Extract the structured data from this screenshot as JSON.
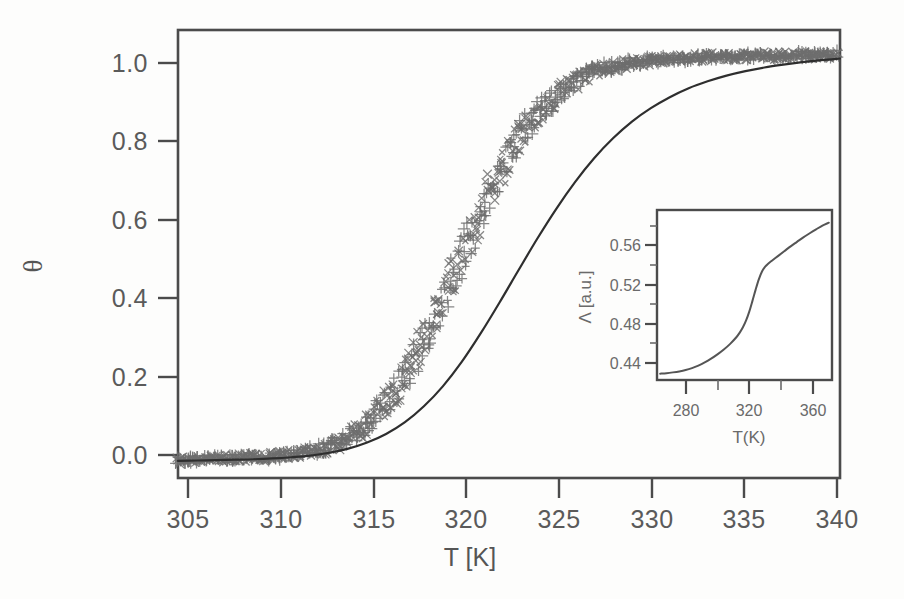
{
  "figure": {
    "background_color": "#fdfdfc",
    "ink_color": "#4b4b4b",
    "marker_color": "#6e6e6e",
    "fit_color": "#2e2e2e"
  },
  "chart_data": {
    "type": "line",
    "title": "",
    "subtitle": "",
    "xlabel": "T [K]",
    "ylabel": "θ",
    "xlim": [
      305,
      340
    ],
    "ylim": [
      -0.04,
      1.06
    ],
    "xticks": [
      305,
      310,
      315,
      320,
      325,
      330,
      335,
      340
    ],
    "xticklabels": [
      "305",
      "310",
      "315",
      "320",
      "325",
      "330",
      "335",
      "340"
    ],
    "yticks": [
      0.0,
      0.2,
      0.4,
      0.6,
      0.8,
      1.0
    ],
    "yticklabels": [
      "0.0",
      "0.2",
      "0.4",
      "0.6",
      "0.8",
      "1.0"
    ],
    "grid": false,
    "legend": "none",
    "series": [
      {
        "name": "experimental-data",
        "style": "scatter-plus-markers",
        "marker": "+",
        "color": "#6e6e6e",
        "note": "dense noisy sigmoidal data points",
        "x": [
          305.0,
          305.5,
          306.0,
          306.5,
          307.0,
          307.5,
          308.0,
          308.5,
          309.0,
          309.5,
          310.0,
          310.5,
          311.0,
          311.5,
          312.0,
          312.5,
          313.0,
          313.5,
          314.0,
          314.5,
          315.0,
          315.5,
          316.0,
          316.5,
          317.0,
          317.5,
          318.0,
          318.5,
          319.0,
          319.5,
          320.0,
          320.5,
          321.0,
          321.5,
          322.0,
          322.5,
          323.0,
          323.5,
          324.0,
          324.5,
          325.0,
          325.5,
          326.0,
          326.5,
          327.0,
          327.5,
          328.0,
          328.5,
          329.0,
          329.5,
          330.0,
          330.5,
          331.0,
          331.5,
          332.0,
          332.5,
          333.0,
          333.5,
          334.0,
          334.5,
          335.0,
          335.5,
          336.0,
          336.5,
          337.0,
          337.5,
          338.0,
          338.5,
          339.0,
          339.5,
          340.0
        ],
        "y": [
          0.005,
          0.006,
          0.006,
          0.007,
          0.007,
          0.008,
          0.009,
          0.01,
          0.011,
          0.012,
          0.013,
          0.015,
          0.017,
          0.02,
          0.024,
          0.029,
          0.036,
          0.045,
          0.057,
          0.072,
          0.091,
          0.113,
          0.14,
          0.171,
          0.207,
          0.247,
          0.292,
          0.34,
          0.391,
          0.444,
          0.498,
          0.552,
          0.604,
          0.654,
          0.7,
          0.743,
          0.782,
          0.817,
          0.847,
          0.873,
          0.896,
          0.915,
          0.93,
          0.943,
          0.954,
          0.962,
          0.969,
          0.975,
          0.979,
          0.982,
          0.985,
          0.987,
          0.989,
          0.99,
          0.992,
          0.993,
          0.994,
          0.994,
          0.995,
          0.996,
          0.996,
          0.997,
          0.997,
          0.997,
          0.998,
          0.998,
          0.998,
          0.999,
          0.999,
          0.999,
          1.0
        ]
      },
      {
        "name": "fit-curve",
        "style": "solid-line",
        "color": "#2e2e2e",
        "note": "smooth sigmoidal fit, shifted slightly to higher T",
        "x": [
          305.0,
          306.0,
          307.0,
          308.0,
          309.0,
          310.0,
          311.0,
          312.0,
          313.0,
          314.0,
          315.0,
          316.0,
          317.0,
          318.0,
          319.0,
          320.0,
          321.0,
          322.0,
          323.0,
          324.0,
          325.0,
          326.0,
          327.0,
          328.0,
          329.0,
          330.0,
          331.0,
          332.0,
          333.0,
          334.0,
          335.0,
          336.0,
          337.0,
          338.0,
          339.0,
          340.0
        ],
        "y": [
          0.002,
          0.003,
          0.004,
          0.005,
          0.006,
          0.008,
          0.011,
          0.015,
          0.022,
          0.032,
          0.047,
          0.068,
          0.097,
          0.136,
          0.185,
          0.245,
          0.315,
          0.391,
          0.47,
          0.548,
          0.621,
          0.687,
          0.745,
          0.794,
          0.835,
          0.868,
          0.895,
          0.917,
          0.934,
          0.948,
          0.959,
          0.968,
          0.975,
          0.981,
          0.986,
          0.99
        ]
      }
    ],
    "inset": {
      "type": "line",
      "xlabel": "T(K)",
      "ylabel": "Λ [a.u.]",
      "xlim": [
        262,
        372
      ],
      "ylim": [
        0.418,
        0.592
      ],
      "xticks": [
        280,
        320,
        360
      ],
      "xticklabels": [
        "280",
        "320",
        "360"
      ],
      "xminorticks": [
        300,
        340
      ],
      "yticks": [
        0.44,
        0.48,
        0.52,
        0.56
      ],
      "yticklabels": [
        "0.44",
        "0.48",
        "0.52",
        "0.56"
      ],
      "yminorticks": [
        0.46,
        0.5,
        0.54,
        0.58
      ],
      "grid": false,
      "series": [
        {
          "name": "lambda-curve",
          "style": "solid-line",
          "color": "#555555",
          "x": [
            264,
            268,
            272,
            276,
            280,
            284,
            288,
            292,
            296,
            300,
            304,
            308,
            312,
            314,
            316,
            318,
            320,
            322,
            324,
            326,
            328,
            330,
            332,
            334,
            338,
            342,
            346,
            350,
            354,
            358,
            362,
            366,
            370
          ],
          "y": [
            0.4245,
            0.425,
            0.4258,
            0.4268,
            0.4282,
            0.4302,
            0.4328,
            0.436,
            0.4398,
            0.4442,
            0.4492,
            0.455,
            0.462,
            0.4665,
            0.472,
            0.479,
            0.488,
            0.499,
            0.5105,
            0.521,
            0.529,
            0.534,
            0.5372,
            0.5398,
            0.5448,
            0.5498,
            0.5548,
            0.5594,
            0.564,
            0.5682,
            0.5722,
            0.576,
            0.579
          ]
        }
      ]
    }
  }
}
